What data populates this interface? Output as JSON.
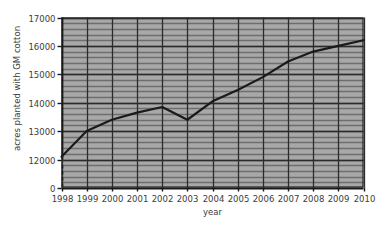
{
  "chart_data": {
    "type": "line",
    "title": "",
    "xlabel": "year",
    "ylabel": "acres planted with GM cotton",
    "categories": [
      1998,
      1999,
      2000,
      2001,
      2002,
      2003,
      2004,
      2005,
      2006,
      2007,
      2008,
      2009,
      2010
    ],
    "x_tick_labels": [
      "1998",
      "1999",
      "2000",
      "2001",
      "2002",
      "2003",
      "2004",
      "2005",
      "2006",
      "2007",
      "2008",
      "2009",
      "2010"
    ],
    "values": [
      12100,
      13000,
      13400,
      13650,
      13850,
      13400,
      14050,
      14450,
      14900,
      15450,
      15800,
      16000,
      16200
    ],
    "y_tick_labels": [
      "0",
      "12000",
      "13000",
      "14000",
      "15000",
      "16000",
      "17000"
    ],
    "y_tick_values": [
      0,
      12000,
      13000,
      14000,
      15000,
      16000,
      17000
    ],
    "ylim": [
      12000,
      17000
    ],
    "y_axis_break": true,
    "y_axis_break_note": "axis broken between 0 and 12000",
    "xlim": [
      1998,
      2010
    ],
    "grid": true,
    "grid_minor_horizontal": true,
    "minor_per_major": 5,
    "legend": "none",
    "colors": {
      "plot_background": "#a8a8a8",
      "line": "#1a1a1a",
      "major_gridline": "#2b2b2b",
      "minor_gridline": "#6e6e6e",
      "axis": "#1a1a1a",
      "text": "#3c3c3c",
      "page_background": "#ffffff"
    }
  }
}
